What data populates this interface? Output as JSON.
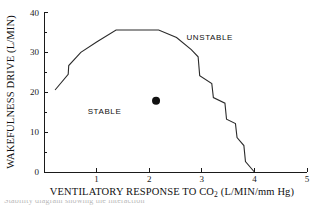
{
  "chart_data": {
    "type": "line",
    "title": "",
    "xlabel": "VENTILATORY RESPONSE TO CO2 (L/MIN/mm Hg)",
    "xlabel_main": "VENTILATORY RESPONSE TO CO",
    "xlabel_sub": "2",
    "xlabel_tail": " (L/MIN/mm Hg)",
    "ylabel": "WAKEFULNESS DRIVE (L/MIN)",
    "xlim": [
      0,
      5
    ],
    "ylim": [
      0,
      40
    ],
    "xticks": [
      0,
      1,
      2,
      3,
      4,
      5
    ],
    "xtick_labels": [
      "0",
      "1",
      "2",
      "3",
      "4",
      "5"
    ],
    "yticks": [
      0,
      10,
      20,
      30,
      40
    ],
    "ytick_labels": [
      "0",
      "10",
      "20",
      "30",
      "40"
    ],
    "yminor_ticks": [
      5,
      15,
      25,
      35
    ],
    "grid": false,
    "legend_position": "none",
    "series": [
      {
        "name": "stability boundary",
        "type": "line",
        "color": "#2b2b2b",
        "x": [
          0.21,
          0.46,
          0.47,
          0.7,
          1.0,
          1.37,
          2.18,
          2.52,
          2.8,
          2.93,
          2.96,
          3.19,
          3.22,
          3.44,
          3.47,
          3.64,
          3.67,
          3.8,
          3.83,
          4.0
        ],
        "y": [
          20.5,
          24.4,
          26.6,
          29.9,
          32.5,
          35.5,
          35.5,
          33.6,
          30.6,
          28.8,
          24.1,
          22.1,
          18.6,
          17.2,
          13.2,
          12.1,
          8.6,
          6.6,
          2.6,
          0.0
        ]
      }
    ],
    "points": [
      {
        "name": "subject-data-point",
        "x": 2.13,
        "y": 17.8,
        "marker": "filled-circle",
        "color": "#111111",
        "size": 5
      }
    ],
    "annotations": [
      {
        "name": "stable-region-label",
        "text": "STABLE",
        "x": 1.15,
        "y": 14.5
      },
      {
        "name": "unstable-region-label",
        "text": "UNSTABLE",
        "x": 3.15,
        "y": 33.0
      }
    ]
  },
  "caption": {
    "text": "Stability diagram showing the interaction"
  },
  "colors": {
    "axis": "#1a1a1a",
    "curve": "#2b2b2b",
    "marker": "#111111",
    "background": "#ffffff"
  }
}
